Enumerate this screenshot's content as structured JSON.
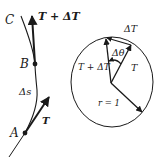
{
  "diagram": {
    "colors": {
      "stroke": "#1a1a1a",
      "background": "#ffffff"
    },
    "left_panel": {
      "points": [
        {
          "id": "A",
          "label": "A"
        },
        {
          "id": "B",
          "label": "B"
        },
        {
          "id": "C",
          "label": "C"
        }
      ],
      "arc_label": "Δs",
      "vectors": [
        {
          "id": "T_at_A",
          "label": "T"
        },
        {
          "id": "T_plus_dT_at_B",
          "label": "T + ΔT"
        }
      ]
    },
    "right_panel": {
      "circle_label": "r = 1",
      "vectors": [
        {
          "id": "T",
          "label": "T"
        },
        {
          "id": "T_plus_dT",
          "label": "T + ΔT"
        },
        {
          "id": "dT",
          "label": "ΔT"
        }
      ],
      "angle_label": "Δθ"
    }
  }
}
